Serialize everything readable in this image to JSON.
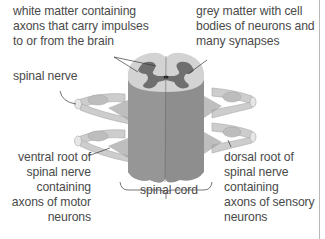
{
  "labels": {
    "white_matter": [
      "white matter containing",
      "axons that carry impulses",
      "to or from the brain"
    ],
    "grey_matter": [
      "grey matter with cell",
      "bodies of neurons and",
      "many synapses"
    ],
    "spinal_nerve": [
      "spinal nerve"
    ],
    "ventral_root": [
      "ventral root of",
      "spinal nerve",
      "containing",
      "axons of motor",
      "neurons"
    ],
    "spinal_cord": [
      "spinal cord"
    ],
    "dorsal_root": [
      "dorsal root of",
      "spinal nerve",
      "containing",
      "axons of  sensory",
      "neurons"
    ]
  },
  "colors": {
    "white_matter": "#d3d3d3",
    "grey_matter": "#6f6f6f",
    "cord_body": "#8c8c8c",
    "nerve": "#c9c9c9",
    "text": "#4a4a4a",
    "leader": "#3a3a3a"
  }
}
